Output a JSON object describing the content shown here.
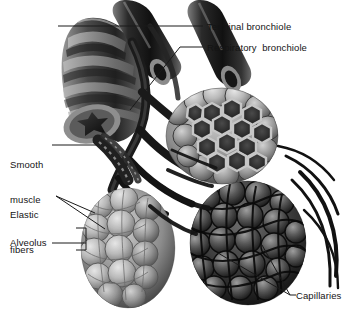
{
  "figure": {
    "width": 364,
    "height": 324,
    "background_color": "#ffffff",
    "ink_color": "#141414",
    "style": "grayscale airbrush anatomical illustration"
  },
  "labels": {
    "terminal_bronchiole": "Terminal bronchiole",
    "respiratory_bronchiole": "Respiratory  bronchiole",
    "smooth_muscle_line1": "Smooth",
    "smooth_muscle_line2": "muscle",
    "elastic_fibers_line1": "Elastic",
    "elastic_fibers_line2": "fibers",
    "alveolus": "Alveolus",
    "capillaries": "Capillaries"
  },
  "structures": [
    {
      "name": "cartilage-ringed-bronchus",
      "description": "cut ringed airway upper left with star-shaped lumen"
    },
    {
      "name": "bronchiole-tube-upper-middle",
      "description": "cut smooth tube"
    },
    {
      "name": "bronchiole-tube-upper-right",
      "description": "cut smooth tube"
    },
    {
      "name": "alveolar-sac-cutaway",
      "description": "honeycomb cutaway of alveoli, upper middle right"
    },
    {
      "name": "alveolar-sac-light",
      "description": "pale grape-like alveolar cluster, lower left"
    },
    {
      "name": "alveolar-sac-capillary-covered",
      "description": "dark alveolar cluster sheathed in capillaries, lower right"
    },
    {
      "name": "capillary-network",
      "description": "fine vessels wrapping the alveolar sacs"
    }
  ]
}
